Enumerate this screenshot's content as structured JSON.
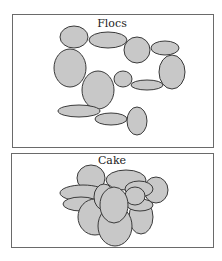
{
  "panels": [
    {
      "id": "flocs",
      "label": "Flocs",
      "box": {
        "x": 12,
        "y": 14,
        "w": 201,
        "h": 133
      },
      "label_pos": {
        "x": 112,
        "y": 27
      },
      "particles": [
        {
          "cx": 74,
          "cy": 37,
          "rx": 14,
          "ry": 11
        },
        {
          "cx": 108,
          "cy": 40,
          "rx": 19,
          "ry": 8
        },
        {
          "cx": 137,
          "cy": 50,
          "rx": 13,
          "ry": 13
        },
        {
          "cx": 165,
          "cy": 48,
          "rx": 14,
          "ry": 7
        },
        {
          "cx": 70,
          "cy": 68,
          "rx": 16,
          "ry": 19
        },
        {
          "cx": 172,
          "cy": 72,
          "rx": 13,
          "ry": 17
        },
        {
          "cx": 98,
          "cy": 90,
          "rx": 16,
          "ry": 19
        },
        {
          "cx": 123,
          "cy": 79,
          "rx": 9,
          "ry": 8
        },
        {
          "cx": 147,
          "cy": 85,
          "rx": 16,
          "ry": 5
        },
        {
          "cx": 79,
          "cy": 111,
          "rx": 21,
          "ry": 6
        },
        {
          "cx": 111,
          "cy": 119,
          "rx": 16,
          "ry": 6
        },
        {
          "cx": 137,
          "cy": 121,
          "rx": 10,
          "ry": 14
        }
      ]
    },
    {
      "id": "cake",
      "label": "Cake",
      "box": {
        "x": 11,
        "y": 153,
        "w": 202,
        "h": 94
      },
      "label_pos": {
        "x": 112,
        "y": 164
      },
      "particles": [
        {
          "cx": 91,
          "cy": 178,
          "rx": 14,
          "ry": 13
        },
        {
          "cx": 126,
          "cy": 180,
          "rx": 20,
          "ry": 10
        },
        {
          "cx": 156,
          "cy": 190,
          "rx": 12,
          "ry": 13
        },
        {
          "cx": 83,
          "cy": 193,
          "rx": 23,
          "ry": 8
        },
        {
          "cx": 81,
          "cy": 204,
          "rx": 18,
          "ry": 7
        },
        {
          "cx": 95,
          "cy": 217,
          "rx": 17,
          "ry": 18
        },
        {
          "cx": 141,
          "cy": 217,
          "rx": 12,
          "ry": 17
        },
        {
          "cx": 115,
          "cy": 226,
          "rx": 17,
          "ry": 20
        },
        {
          "cx": 104,
          "cy": 197,
          "rx": 10,
          "ry": 13
        },
        {
          "cx": 139,
          "cy": 189,
          "rx": 14,
          "ry": 8
        },
        {
          "cx": 140,
          "cy": 205,
          "rx": 13,
          "ry": 6
        },
        {
          "cx": 135,
          "cy": 196,
          "rx": 10,
          "ry": 9
        },
        {
          "cx": 114,
          "cy": 205,
          "rx": 14,
          "ry": 18
        }
      ]
    }
  ],
  "colors": {
    "particle_fill": "#c8c8c8",
    "particle_stroke": "#3a3a3a",
    "box_stroke": "#6a6a6a",
    "background": "#ffffff"
  }
}
